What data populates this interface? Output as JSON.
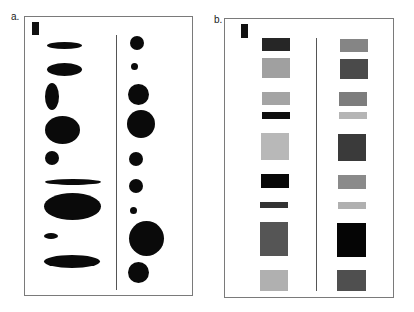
{
  "figure": {
    "panels": [
      {
        "label": "a.",
        "label_pos": [
          11,
          12
        ],
        "box": [
          24,
          16,
          169,
          280
        ],
        "divider": {
          "x": 116,
          "y1": 35,
          "y2": 290
        },
        "marker": {
          "x": 32,
          "y": 22,
          "w": 7,
          "h": 13,
          "color": "#111111"
        },
        "left_column_title": "ellipses (varying width and height)",
        "left_shapes": [
          {
            "cx": 64,
            "cy": 45,
            "w": 35,
            "h": 7
          },
          {
            "cx": 64,
            "cy": 69,
            "w": 35,
            "h": 13
          },
          {
            "cx": 52,
            "cy": 96,
            "w": 14,
            "h": 27
          },
          {
            "cx": 62,
            "cy": 130,
            "w": 35,
            "h": 28
          },
          {
            "cx": 52,
            "cy": 158,
            "w": 14,
            "h": 14
          },
          {
            "cx": 73,
            "cy": 182,
            "w": 56,
            "h": 6
          },
          {
            "cx": 72,
            "cy": 206,
            "w": 57,
            "h": 27
          },
          {
            "cx": 51,
            "cy": 236,
            "w": 14,
            "h": 6
          },
          {
            "cx": 72,
            "cy": 261,
            "w": 56,
            "h": 13
          }
        ],
        "right_column_title": "circles (varying diameter)",
        "right_shapes": [
          {
            "cx": 137,
            "cy": 43,
            "d": 14
          },
          {
            "cx": 134,
            "cy": 66,
            "d": 7
          },
          {
            "cx": 138,
            "cy": 94,
            "d": 21
          },
          {
            "cx": 141,
            "cy": 124,
            "d": 28
          },
          {
            "cx": 136,
            "cy": 159,
            "d": 14
          },
          {
            "cx": 136,
            "cy": 186,
            "d": 14
          },
          {
            "cx": 133,
            "cy": 210,
            "d": 7
          },
          {
            "cx": 146,
            "cy": 238,
            "d": 35
          },
          {
            "cx": 138,
            "cy": 272,
            "d": 21
          }
        ]
      },
      {
        "label": "b.",
        "label_pos": [
          214,
          15
        ],
        "box": [
          224,
          18,
          170,
          280
        ],
        "divider": {
          "x": 316,
          "y1": 38,
          "y2": 291
        },
        "marker": {
          "x": 241,
          "y": 24,
          "w": 7,
          "h": 14,
          "color": "#111111"
        },
        "left_column_title": "rectangles (varying size and gray level)",
        "left_shapes": [
          {
            "x": 262,
            "y": 38,
            "w": 28,
            "h": 13,
            "color": "#262626"
          },
          {
            "x": 262,
            "y": 58,
            "w": 28,
            "h": 20,
            "color": "#a0a0a0"
          },
          {
            "x": 262,
            "y": 92,
            "w": 28,
            "h": 13,
            "color": "#a4a4a4"
          },
          {
            "x": 262,
            "y": 112,
            "w": 28,
            "h": 7,
            "color": "#0e0e0e"
          },
          {
            "x": 261,
            "y": 133,
            "w": 28,
            "h": 27,
            "color": "#b8b8b8"
          },
          {
            "x": 261,
            "y": 174,
            "w": 28,
            "h": 14,
            "color": "#080808"
          },
          {
            "x": 260,
            "y": 202,
            "w": 28,
            "h": 6,
            "color": "#333333"
          },
          {
            "x": 260,
            "y": 222,
            "w": 28,
            "h": 34,
            "color": "#555555"
          },
          {
            "x": 260,
            "y": 270,
            "w": 28,
            "h": 21,
            "color": "#b0b0b0"
          }
        ],
        "right_shapes": [
          {
            "x": 340,
            "y": 39,
            "w": 28,
            "h": 13,
            "color": "#858585"
          },
          {
            "x": 340,
            "y": 59,
            "w": 28,
            "h": 20,
            "color": "#4a4a4a"
          },
          {
            "x": 339,
            "y": 92,
            "w": 28,
            "h": 14,
            "color": "#7d7d7d"
          },
          {
            "x": 339,
            "y": 112,
            "w": 28,
            "h": 7,
            "color": "#b5b5b5"
          },
          {
            "x": 338,
            "y": 134,
            "w": 28,
            "h": 27,
            "color": "#3a3a3a"
          },
          {
            "x": 338,
            "y": 175,
            "w": 28,
            "h": 14,
            "color": "#8a8a8a"
          },
          {
            "x": 338,
            "y": 202,
            "w": 28,
            "h": 7,
            "color": "#b0b0b0"
          },
          {
            "x": 337,
            "y": 223,
            "w": 29,
            "h": 34,
            "color": "#050505"
          },
          {
            "x": 337,
            "y": 270,
            "w": 29,
            "h": 21,
            "color": "#4f4f4f"
          }
        ]
      }
    ]
  }
}
